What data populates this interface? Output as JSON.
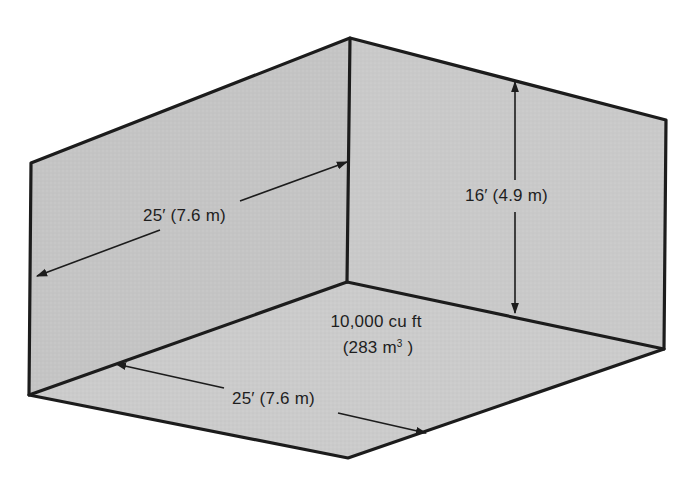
{
  "figure": {
    "colors": {
      "background": "#ffffff",
      "left_wall": "#c4c4c4",
      "right_wall": "#c9c9c9",
      "floor": "#cbcbcb",
      "edge": "#1c1c1c",
      "text": "#1e1e1e"
    }
  },
  "dimensions": {
    "depth": {
      "label": "25′ (7.6 m)",
      "feet": 25,
      "meters": 7.6,
      "position": "left wall"
    },
    "height": {
      "label": "16′ (4.9 m)",
      "feet": 16,
      "meters": 4.9,
      "position": "right wall"
    },
    "width": {
      "label": "25′ (7.6 m)",
      "feet": 25,
      "meters": 7.6,
      "position": "floor front edge"
    }
  },
  "volume": {
    "imperial_label": "10,000 cu ft",
    "metric_label_value": "(283 m",
    "metric_label_exp": "3",
    "metric_label_close": " )",
    "cubic_feet": 10000,
    "cubic_meters": 283
  }
}
